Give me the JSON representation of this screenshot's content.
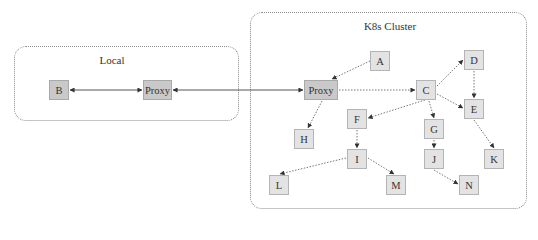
{
  "regions": [
    {
      "id": "local",
      "label": "Local",
      "x": 14,
      "y": 46,
      "w": 225,
      "h": 75,
      "label_x": 112,
      "label_y": 54
    },
    {
      "id": "k8s",
      "label": "K8s Cluster",
      "x": 250,
      "y": 12,
      "w": 277,
      "h": 197,
      "label_x": 390,
      "label_y": 20
    }
  ],
  "nodes": [
    {
      "id": "B",
      "label": "B",
      "x": 49,
      "y": 80,
      "w": 20,
      "h": 20,
      "style": "dark"
    },
    {
      "id": "ProxyLocal",
      "label": "Proxy",
      "x": 143,
      "y": 80,
      "w": 29,
      "h": 20,
      "style": "dark"
    },
    {
      "id": "ProxyK8s",
      "label": "Proxy",
      "x": 304,
      "y": 80,
      "w": 34,
      "h": 20,
      "style": "dark"
    },
    {
      "id": "A",
      "label": "A",
      "x": 370,
      "y": 51,
      "w": 20,
      "h": 20,
      "style": "light"
    },
    {
      "id": "C",
      "label": "C",
      "x": 416,
      "y": 80,
      "w": 20,
      "h": 20,
      "style": "light"
    },
    {
      "id": "D",
      "label": "D",
      "x": 464,
      "y": 50,
      "w": 20,
      "h": 20,
      "style": "light"
    },
    {
      "id": "E",
      "label": "E",
      "x": 464,
      "y": 99,
      "w": 20,
      "h": 20,
      "style": "light"
    },
    {
      "id": "F",
      "label": "F",
      "x": 347,
      "y": 109,
      "w": 20,
      "h": 20,
      "style": "light"
    },
    {
      "id": "G",
      "label": "G",
      "x": 424,
      "y": 119,
      "w": 20,
      "h": 20,
      "style": "light"
    },
    {
      "id": "H",
      "label": "H",
      "x": 294,
      "y": 129,
      "w": 20,
      "h": 20,
      "style": "light"
    },
    {
      "id": "I",
      "label": "I",
      "x": 347,
      "y": 149,
      "w": 20,
      "h": 20,
      "style": "light"
    },
    {
      "id": "J",
      "label": "J",
      "x": 424,
      "y": 149,
      "w": 20,
      "h": 20,
      "style": "light"
    },
    {
      "id": "K",
      "label": "K",
      "x": 484,
      "y": 149,
      "w": 20,
      "h": 20,
      "style": "light"
    },
    {
      "id": "L",
      "label": "L",
      "x": 269,
      "y": 175,
      "w": 20,
      "h": 20,
      "style": "light"
    },
    {
      "id": "M",
      "label": "M",
      "x": 386,
      "y": 175,
      "w": 20,
      "h": 20,
      "style": "light"
    },
    {
      "id": "N",
      "label": "N",
      "x": 459,
      "y": 175,
      "w": 20,
      "h": 20,
      "style": "light"
    }
  ],
  "edges": [
    {
      "from": "B",
      "to": "ProxyLocal",
      "style": "solid",
      "bidirectional": true,
      "x1": 70,
      "y1": 90,
      "x2": 142,
      "y2": 90
    },
    {
      "from": "ProxyLocal",
      "to": "ProxyK8s",
      "style": "solid",
      "bidirectional": true,
      "x1": 173,
      "y1": 90,
      "x2": 303,
      "y2": 90
    },
    {
      "from": "A",
      "to": "ProxyK8s",
      "style": "dotted",
      "x1": 370,
      "y1": 61,
      "x2": 332,
      "y2": 79
    },
    {
      "from": "ProxyK8s",
      "to": "C",
      "style": "dotted",
      "x1": 339,
      "y1": 90,
      "x2": 415,
      "y2": 90
    },
    {
      "from": "ProxyK8s",
      "to": "H",
      "style": "dotted",
      "x1": 322,
      "y1": 101,
      "x2": 308,
      "y2": 128
    },
    {
      "from": "C",
      "to": "D",
      "style": "dotted",
      "x1": 437,
      "y1": 86,
      "x2": 463,
      "y2": 60
    },
    {
      "from": "C",
      "to": "E",
      "style": "dotted",
      "x1": 437,
      "y1": 94,
      "x2": 463,
      "y2": 108
    },
    {
      "from": "C",
      "to": "F",
      "style": "dotted",
      "x1": 425,
      "y1": 100,
      "x2": 368,
      "y2": 118
    },
    {
      "from": "C",
      "to": "G",
      "style": "dotted",
      "x1": 429,
      "y1": 101,
      "x2": 434,
      "y2": 118
    },
    {
      "from": "D",
      "to": "E",
      "style": "dotted",
      "x1": 474,
      "y1": 71,
      "x2": 474,
      "y2": 98
    },
    {
      "from": "E",
      "to": "K",
      "style": "dotted",
      "x1": 474,
      "y1": 120,
      "x2": 494,
      "y2": 148
    },
    {
      "from": "F",
      "to": "I",
      "style": "dotted",
      "x1": 357,
      "y1": 130,
      "x2": 357,
      "y2": 148
    },
    {
      "from": "G",
      "to": "J",
      "style": "dotted",
      "x1": 434,
      "y1": 140,
      "x2": 434,
      "y2": 148
    },
    {
      "from": "I",
      "to": "L",
      "style": "dotted",
      "x1": 346,
      "y1": 158,
      "x2": 280,
      "y2": 174
    },
    {
      "from": "I",
      "to": "M",
      "style": "dotted",
      "x1": 368,
      "y1": 158,
      "x2": 394,
      "y2": 174
    },
    {
      "from": "J",
      "to": "N",
      "style": "dotted",
      "x1": 434,
      "y1": 170,
      "x2": 458,
      "y2": 184
    }
  ]
}
